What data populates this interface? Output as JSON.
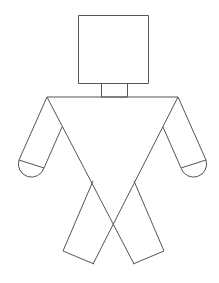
{
  "figure": {
    "stroke_color": "#555555",
    "background": "#ffffff",
    "parts": [
      {
        "name": "head",
        "shape": "square"
      },
      {
        "name": "neck",
        "shape": "rectangle"
      },
      {
        "name": "torso",
        "shape": "inverted-triangle"
      },
      {
        "name": "left-arm",
        "shape": "rectangle-with-semicircle-hand"
      },
      {
        "name": "right-arm",
        "shape": "rectangle-with-semicircle-hand"
      },
      {
        "name": "left-leg",
        "shape": "rectangle"
      },
      {
        "name": "right-leg",
        "shape": "rectangle"
      }
    ]
  }
}
